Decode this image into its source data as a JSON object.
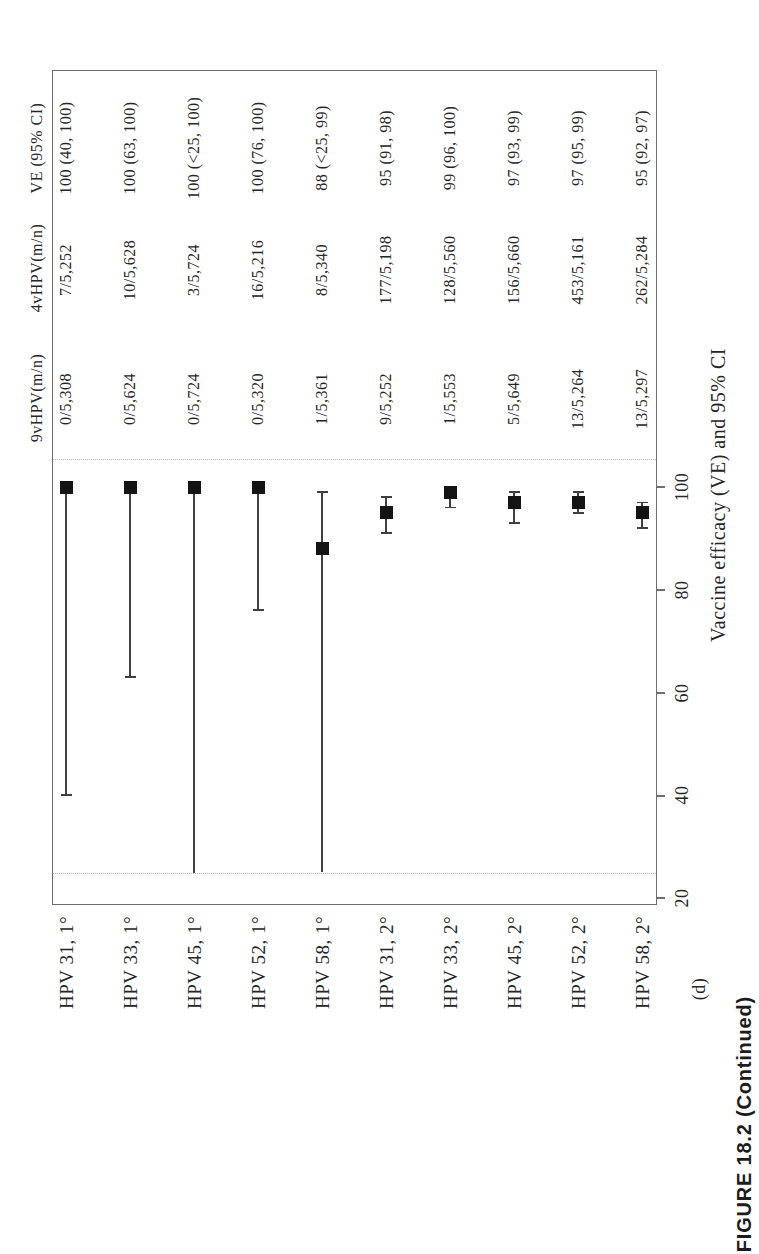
{
  "caption": "FIGURE 18.2 (Continued)",
  "figure_label": "(d)",
  "table": {
    "headers": [
      "9vHPV(m/n)",
      "4vHPV(m/n)",
      "VE (95% CI)"
    ]
  },
  "chart_data": {
    "type": "scatter",
    "subtype": "forest-plot",
    "orientation": "rotated-90-counterclockwise",
    "title": "",
    "xlabel": "Vaccine efficacy (VE) and 95% CI",
    "ylabel": "",
    "axis_ticks": [
      20,
      40,
      60,
      80,
      100
    ],
    "xlim": [
      20,
      105.5
    ],
    "clip_range": [
      25,
      105.5
    ],
    "grid": false,
    "legend": false,
    "marker": "filled-square",
    "colors": {
      "marker": "#141414",
      "ci_line": "#3f3f3f",
      "frame": "#6e6e6e",
      "dotted_guide": "#b3b3b3",
      "text": "#262626"
    },
    "rows": [
      {
        "label": "HPV 31, 1°",
        "nine_v": "0/5,308",
        "four_v": "7/5,252",
        "ve_text": "100 (40, 100)",
        "ve": 100,
        "ci_low": 40,
        "ci_high": 100,
        "ci_low_truncated": false
      },
      {
        "label": "HPV 33, 1°",
        "nine_v": "0/5,624",
        "four_v": "10/5,628",
        "ve_text": "100 (63, 100)",
        "ve": 100,
        "ci_low": 63,
        "ci_high": 100,
        "ci_low_truncated": false
      },
      {
        "label": "HPV 45, 1°",
        "nine_v": "0/5,724",
        "four_v": "3/5,724",
        "ve_text": "100 (<25, 100)",
        "ve": 100,
        "ci_low": 25,
        "ci_high": 100,
        "ci_low_truncated": true
      },
      {
        "label": "HPV 52, 1°",
        "nine_v": "0/5,320",
        "four_v": "16/5,216",
        "ve_text": "100 (76, 100)",
        "ve": 100,
        "ci_low": 76,
        "ci_high": 100,
        "ci_low_truncated": false
      },
      {
        "label": "HPV 58, 1°",
        "nine_v": "1/5,361",
        "four_v": "8/5,340",
        "ve_text": "88 (<25, 99)",
        "ve": 88,
        "ci_low": 25,
        "ci_high": 99,
        "ci_low_truncated": true
      },
      {
        "label": "HPV 31, 2°",
        "nine_v": "9/5,252",
        "four_v": "177/5,198",
        "ve_text": "95 (91, 98)",
        "ve": 95,
        "ci_low": 91,
        "ci_high": 98,
        "ci_low_truncated": false
      },
      {
        "label": "HPV 33, 2°",
        "nine_v": "1/5,553",
        "four_v": "128/5,560",
        "ve_text": "99 (96, 100)",
        "ve": 99,
        "ci_low": 96,
        "ci_high": 100,
        "ci_low_truncated": false
      },
      {
        "label": "HPV 45, 2°",
        "nine_v": "5/5,649",
        "four_v": "156/5,660",
        "ve_text": "97 (93, 99)",
        "ve": 97,
        "ci_low": 93,
        "ci_high": 99,
        "ci_low_truncated": false
      },
      {
        "label": "HPV 52, 2°",
        "nine_v": "13/5,264",
        "four_v": "453/5,161",
        "ve_text": "97 (95, 99)",
        "ve": 97,
        "ci_low": 95,
        "ci_high": 99,
        "ci_low_truncated": false
      },
      {
        "label": "HPV 58, 2°",
        "nine_v": "13/5,297",
        "four_v": "262/5,284",
        "ve_text": "95 (92, 97)",
        "ve": 95,
        "ci_low": 92,
        "ci_high": 97,
        "ci_low_truncated": false
      }
    ]
  }
}
